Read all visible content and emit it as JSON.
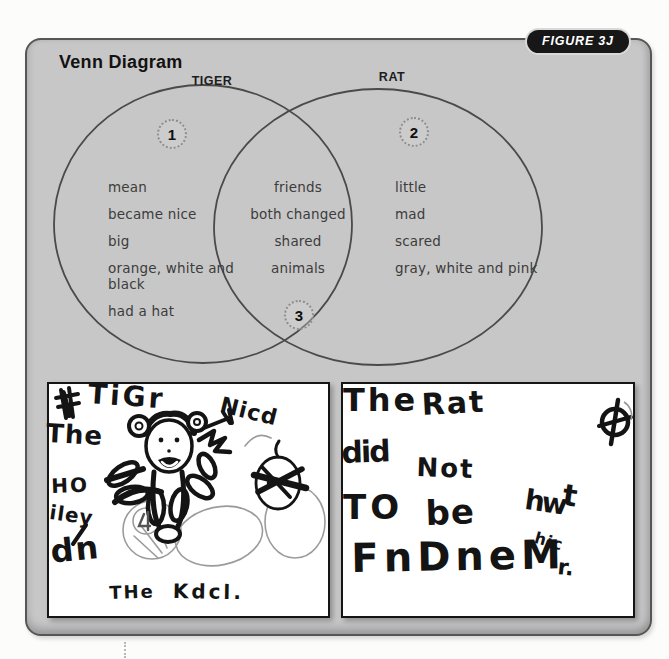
{
  "figure_badge": "FIGURE 3J",
  "title": "Venn Diagram",
  "venn": {
    "left_label": "TIGER",
    "right_label": "RAT",
    "numbers": [
      "1",
      "2",
      "3"
    ],
    "left_items": [
      "mean",
      "became nice",
      "big",
      "orange, white and\nblack",
      "had a hat"
    ],
    "shared_items": [
      "friends",
      "both changed",
      "shared",
      "animals"
    ],
    "right_items": [
      "little",
      "mad",
      "scared",
      "gray, white and pink"
    ]
  },
  "drawings": {
    "left_words": [
      {
        "t": "TiGr",
        "x": 40,
        "y": -4,
        "s": 28,
        "r": 4,
        "ls": 3
      },
      {
        "t": "The",
        "x": -2,
        "y": 36,
        "s": 26,
        "r": 3,
        "ls": 1
      },
      {
        "t": "Nicd",
        "x": 174,
        "y": 10,
        "s": 22,
        "r": 14,
        "ls": 1
      },
      {
        "t": "HO",
        "x": 2,
        "y": 92,
        "s": 20,
        "r": -2,
        "ls": 2
      },
      {
        "t": "iley",
        "x": 2,
        "y": 118,
        "s": 20,
        "r": 8,
        "ls": 1
      },
      {
        "t": "dn",
        "x": 0,
        "y": 152,
        "s": 32,
        "r": -6,
        "ls": 2
      },
      {
        "t": "THe",
        "x": 60,
        "y": 200,
        "s": 18,
        "r": -2,
        "ls": 2
      },
      {
        "t": "Kdcl.",
        "x": 124,
        "y": 197,
        "s": 20,
        "r": 1,
        "ls": 3
      }
    ],
    "right_words": [
      {
        "t": "The",
        "x": 0,
        "y": 0,
        "s": 32,
        "r": 0,
        "ls": 3
      },
      {
        "t": "Rat",
        "x": 78,
        "y": 6,
        "s": 30,
        "r": -3,
        "ls": 2
      },
      {
        "t": "did",
        "x": -2,
        "y": 54,
        "s": 30,
        "r": -2,
        "ls": -2
      },
      {
        "t": "Not",
        "x": 74,
        "y": 70,
        "s": 26,
        "r": 2,
        "ls": 2
      },
      {
        "t": "TO",
        "x": 0,
        "y": 106,
        "s": 34,
        "r": 0,
        "ls": 4
      },
      {
        "t": "be",
        "x": 82,
        "y": 112,
        "s": 34,
        "r": -2,
        "ls": 1
      },
      {
        "t": "hw",
        "x": 184,
        "y": 102,
        "s": 28,
        "r": 8,
        "ls": -3
      },
      {
        "t": "t",
        "x": 222,
        "y": 96,
        "s": 30,
        "r": 8,
        "ls": 0
      },
      {
        "t": "hic",
        "x": 194,
        "y": 146,
        "s": 16,
        "r": 16,
        "ls": 1
      },
      {
        "t": "FnDneM",
        "x": 8,
        "y": 154,
        "s": 40,
        "r": -1,
        "ls": 5
      },
      {
        "t": "r.",
        "x": 216,
        "y": 172,
        "s": 22,
        "r": 6,
        "ls": 0
      }
    ]
  },
  "colors": {
    "panel_bg": "#c7c7c7",
    "panel_border": "#565656",
    "badge_bg": "#171717",
    "badge_text": "#ffffff",
    "venn_stroke": "#4a4a4a",
    "venn_text": "#3c3c3c",
    "ink": "#141414",
    "pencil": "#9b9b9b"
  }
}
